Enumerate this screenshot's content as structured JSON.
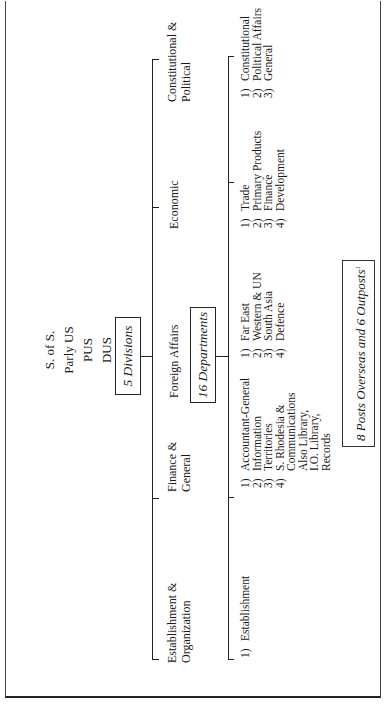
{
  "document": {
    "type": "organization-chart",
    "orientation": "rotated-90-ccw",
    "top_hierarchy": [
      "S. of S.",
      "Parly US",
      "PUS",
      "DUS",
      "5 AUS"
    ],
    "divisions_box": "5 Divisions",
    "departments_box": "16 Departments",
    "divisions": [
      {
        "label_lines": [
          "Establishment &",
          "Organization"
        ],
        "departments": [
          {
            "num": "1)",
            "lines": [
              "Establishment"
            ]
          }
        ]
      },
      {
        "label_lines": [
          "Finance &",
          "General"
        ],
        "departments": [
          {
            "num": "1)",
            "lines": [
              "Accountant-General"
            ]
          },
          {
            "num": "2)",
            "lines": [
              "Information"
            ]
          },
          {
            "num": "3)",
            "lines": [
              "Territories"
            ]
          },
          {
            "num": "4)",
            "lines": [
              "S. Rhodesia &",
              "Communications"
            ]
          }
        ],
        "extra_lines": [
          "Also Library,",
          "I.O. Library,",
          "Records"
        ]
      },
      {
        "label_lines": [
          "Foreign Affairs"
        ],
        "departments": [
          {
            "num": "1)",
            "lines": [
              "Far East"
            ]
          },
          {
            "num": "2)",
            "lines": [
              "Western & UN"
            ]
          },
          {
            "num": "3)",
            "lines": [
              "South Asia"
            ]
          },
          {
            "num": "4)",
            "lines": [
              "Defence"
            ]
          }
        ]
      },
      {
        "label_lines": [
          "Economic"
        ],
        "departments": [
          {
            "num": "1)",
            "lines": [
              "Trade"
            ]
          },
          {
            "num": "2)",
            "lines": [
              "Primary Products"
            ]
          },
          {
            "num": "3)",
            "lines": [
              "Finance"
            ]
          },
          {
            "num": "4)",
            "lines": [
              "Development"
            ]
          }
        ]
      },
      {
        "label_lines": [
          "Constitutional &",
          "Political"
        ],
        "departments": [
          {
            "num": "1)",
            "lines": [
              "Constitutional"
            ]
          },
          {
            "num": "2)",
            "lines": [
              "Political Affairs"
            ]
          },
          {
            "num": "3)",
            "lines": [
              "General"
            ]
          }
        ]
      }
    ],
    "footnote_box": "8 Posts Overseas and 6 Outposts",
    "footnote_marker": "1"
  }
}
